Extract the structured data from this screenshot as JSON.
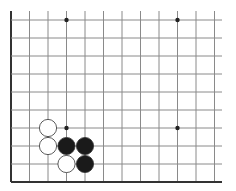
{
  "board": {
    "type": "go-board-fragment",
    "visible_columns": 12,
    "visible_rows": 9,
    "origin_x": 11,
    "origin_y": 20,
    "spacing_x": 18.5,
    "spacing_y": 18,
    "line_top": 11,
    "line_right": 222,
    "edges": {
      "left": true,
      "bottom": true,
      "top": false,
      "right": false
    },
    "line_color": "#8a8a8a",
    "edge_color": "#333333",
    "star_points": [
      {
        "col": 3,
        "row": 0
      },
      {
        "col": 9,
        "row": 0
      },
      {
        "col": 3,
        "row": 6
      },
      {
        "col": 9,
        "row": 6
      }
    ],
    "stones": [
      {
        "color": "white",
        "col": 2,
        "row": 6
      },
      {
        "color": "white",
        "col": 2,
        "row": 7
      },
      {
        "color": "white",
        "col": 3,
        "row": 8
      },
      {
        "color": "black",
        "col": 3,
        "row": 7
      },
      {
        "color": "black",
        "col": 4,
        "row": 7
      },
      {
        "color": "black",
        "col": 4,
        "row": 8
      }
    ],
    "colors": {
      "black_stone": "#1a1a1a",
      "white_stone": "#ffffff",
      "stone_outline": "#333333"
    }
  }
}
